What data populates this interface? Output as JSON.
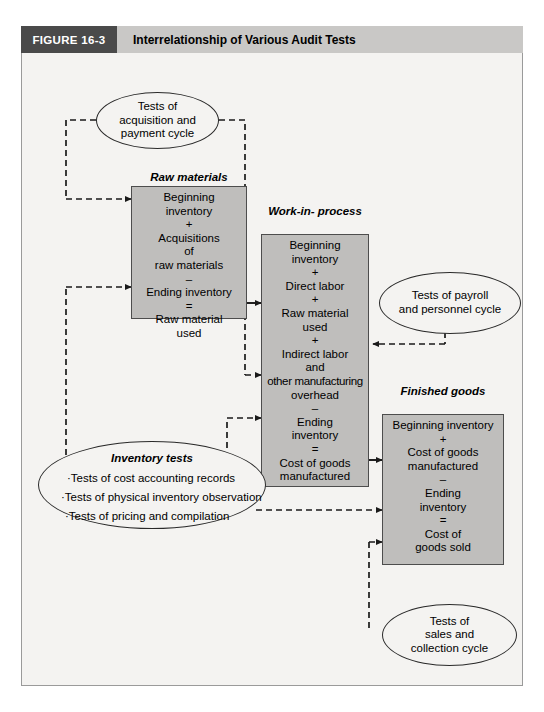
{
  "header": {
    "figure_number": "FIGURE 16-3",
    "title": "Interrelationship of Various Audit Tests",
    "number_box_color": "#4a4a4a",
    "title_bar_color": "#c9c8c6"
  },
  "colors": {
    "box_fill": "#bfbebc",
    "box_border": "#4d4d4d",
    "panel_bg": "#f4f3f1",
    "connector": "#1a1a1a"
  },
  "boxes": {
    "raw_materials": {
      "caption": "Raw materials",
      "lines": [
        "Beginning",
        "inventory",
        "+",
        "Acquisitions",
        "of",
        "raw materials",
        "–",
        "Ending inventory",
        "=",
        "Raw material",
        "used"
      ]
    },
    "work_in_process": {
      "caption_lines": [
        "Work-in-",
        "process"
      ],
      "lines": [
        "Beginning",
        "inventory",
        "+",
        "Direct labor",
        "+",
        "Raw material",
        "used",
        "+",
        "Indirect labor",
        "and",
        "other manufacturing",
        "overhead",
        "–",
        "Ending",
        "inventory",
        "=",
        "Cost of goods",
        "manufactured"
      ]
    },
    "finished_goods": {
      "caption_lines": [
        "Finished",
        "goods"
      ],
      "lines": [
        "Beginning inventory",
        "+",
        "Cost  of goods",
        "manufactured",
        "–",
        "Ending",
        "inventory",
        "=",
        "Cost of",
        "goods sold"
      ]
    }
  },
  "ellipses": {
    "acquisition": {
      "lines": [
        "Tests of",
        "acquisition and",
        "payment cycle"
      ]
    },
    "payroll": {
      "lines": [
        "Tests of payroll",
        "and personnel cycle"
      ]
    },
    "sales": {
      "lines": [
        "Tests of",
        "sales and",
        "collection cycle"
      ]
    },
    "inventory": {
      "title": "Inventory tests",
      "bullets": [
        "·Tests of cost accounting records",
        "·Tests of physical inventory observation",
        "·Tests of pricing and compilation"
      ]
    }
  }
}
